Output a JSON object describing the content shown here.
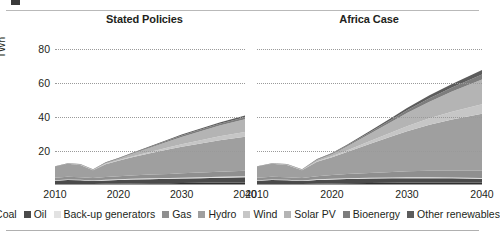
{
  "figure": {
    "crop_mark": "crop-mark",
    "y_axis_label": "TWh"
  },
  "legend": {
    "items": [
      {
        "label": "Coal",
        "color": "#2f2f2f"
      },
      {
        "label": "Oil",
        "color": "#4a4a4a"
      },
      {
        "label": "Back-up generators",
        "color": "#e2e2e2"
      },
      {
        "label": "Gas",
        "color": "#8f8f8f"
      },
      {
        "label": "Hydro",
        "color": "#9f9f9f"
      },
      {
        "label": "Wind",
        "color": "#c6c6c6"
      },
      {
        "label": "Solar PV",
        "color": "#b4b4b4"
      },
      {
        "label": "Bioenergy",
        "color": "#7d7d7d"
      },
      {
        "label": "Other renewables",
        "color": "#5c5c5c"
      }
    ]
  },
  "chart_data": [
    {
      "type": "area",
      "title": "Stated Policies",
      "xlabel": "",
      "ylabel": "TWh",
      "ylim": [
        0,
        88
      ],
      "xlim": [
        2010,
        2040
      ],
      "grid": true,
      "yticks": [
        20,
        40,
        60,
        80
      ],
      "xticks": [
        2010,
        2020,
        2030,
        2040
      ],
      "legend_position": "bottom",
      "x": [
        2010,
        2012,
        2014,
        2016,
        2018,
        2020,
        2022,
        2025,
        2028,
        2030,
        2033,
        2036,
        2040
      ],
      "series": [
        {
          "name": "Coal",
          "values": [
            0.5,
            0.6,
            0.6,
            0.6,
            0.7,
            0.8,
            0.9,
            1.0,
            1.1,
            1.2,
            1.3,
            1.4,
            1.5
          ]
        },
        {
          "name": "Oil",
          "values": [
            2.0,
            2.4,
            2.2,
            1.8,
            2.0,
            2.2,
            2.3,
            2.4,
            2.5,
            2.6,
            2.7,
            2.8,
            3.0
          ]
        },
        {
          "name": "Back-up generators",
          "values": [
            0.3,
            0.3,
            0.3,
            0.3,
            0.4,
            0.4,
            0.4,
            0.5,
            0.5,
            0.5,
            0.6,
            0.6,
            0.6
          ]
        },
        {
          "name": "Gas",
          "values": [
            1.5,
            1.6,
            1.5,
            1.4,
            1.6,
            1.8,
            2.0,
            2.2,
            2.4,
            2.6,
            2.8,
            3.0,
            3.2
          ]
        },
        {
          "name": "Hydro",
          "values": [
            6.5,
            7.5,
            7.2,
            4.5,
            7.5,
            9.0,
            10.5,
            12.5,
            14.5,
            15.5,
            17.0,
            18.5,
            20.0
          ]
        },
        {
          "name": "Wind",
          "values": [
            0.0,
            0.0,
            0.1,
            0.1,
            0.2,
            0.3,
            0.5,
            0.8,
            1.2,
            1.5,
            1.9,
            2.3,
            2.8
          ]
        },
        {
          "name": "Solar PV",
          "values": [
            0.0,
            0.1,
            0.2,
            0.3,
            0.5,
            0.8,
            1.4,
            2.4,
            3.5,
            4.3,
            5.3,
            6.3,
            7.5
          ]
        },
        {
          "name": "Bioenergy",
          "values": [
            0.1,
            0.1,
            0.1,
            0.2,
            0.2,
            0.3,
            0.4,
            0.5,
            0.7,
            0.8,
            0.9,
            1.0,
            1.2
          ]
        },
        {
          "name": "Other renewables",
          "values": [
            0.1,
            0.1,
            0.1,
            0.1,
            0.2,
            0.2,
            0.3,
            0.4,
            0.5,
            0.6,
            0.7,
            0.8,
            1.0
          ]
        }
      ],
      "total_2040": 40.8
    },
    {
      "type": "area",
      "title": "Africa Case",
      "xlabel": "",
      "ylabel": "TWh",
      "ylim": [
        0,
        88
      ],
      "xlim": [
        2010,
        2040
      ],
      "grid": true,
      "yticks": [
        20,
        40,
        60,
        80
      ],
      "xticks": [
        2010,
        2020,
        2030,
        2040
      ],
      "legend_position": "bottom",
      "x": [
        2010,
        2012,
        2014,
        2016,
        2018,
        2020,
        2022,
        2025,
        2028,
        2030,
        2033,
        2036,
        2040
      ],
      "series": [
        {
          "name": "Coal",
          "values": [
            0.5,
            0.6,
            0.6,
            0.6,
            0.8,
            0.9,
            1.0,
            1.2,
            1.3,
            1.4,
            1.5,
            1.5,
            1.5
          ]
        },
        {
          "name": "Oil",
          "values": [
            2.0,
            2.4,
            2.2,
            1.8,
            2.2,
            2.4,
            2.5,
            2.6,
            2.6,
            2.6,
            2.5,
            2.4,
            2.2
          ]
        },
        {
          "name": "Back-up generators",
          "values": [
            0.3,
            0.3,
            0.3,
            0.3,
            0.4,
            0.4,
            0.5,
            0.5,
            0.5,
            0.5,
            0.5,
            0.5,
            0.4
          ]
        },
        {
          "name": "Gas",
          "values": [
            1.5,
            1.6,
            1.5,
            1.4,
            1.8,
            2.1,
            2.4,
            2.8,
            3.2,
            3.5,
            3.8,
            4.0,
            4.2
          ]
        },
        {
          "name": "Hydro",
          "values": [
            6.5,
            7.5,
            7.2,
            4.5,
            8.5,
            10.5,
            13.0,
            17.0,
            21.0,
            23.5,
            27.0,
            30.0,
            33.5
          ]
        },
        {
          "name": "Wind",
          "values": [
            0.0,
            0.0,
            0.1,
            0.1,
            0.3,
            0.5,
            0.9,
            1.6,
            2.4,
            3.0,
            3.8,
            4.6,
            5.6
          ]
        },
        {
          "name": "Solar PV",
          "values": [
            0.0,
            0.1,
            0.2,
            0.3,
            0.7,
            1.3,
            2.3,
            4.2,
            6.3,
            7.8,
            9.8,
            11.8,
            14.5
          ]
        },
        {
          "name": "Bioenergy",
          "values": [
            0.1,
            0.1,
            0.1,
            0.2,
            0.3,
            0.4,
            0.6,
            0.9,
            1.3,
            1.6,
            2.0,
            2.4,
            3.0
          ]
        },
        {
          "name": "Other renewables",
          "values": [
            0.1,
            0.1,
            0.1,
            0.1,
            0.2,
            0.3,
            0.4,
            0.7,
            1.0,
            1.3,
            1.7,
            2.1,
            2.6
          ]
        }
      ],
      "total_2040": 67.5
    }
  ]
}
